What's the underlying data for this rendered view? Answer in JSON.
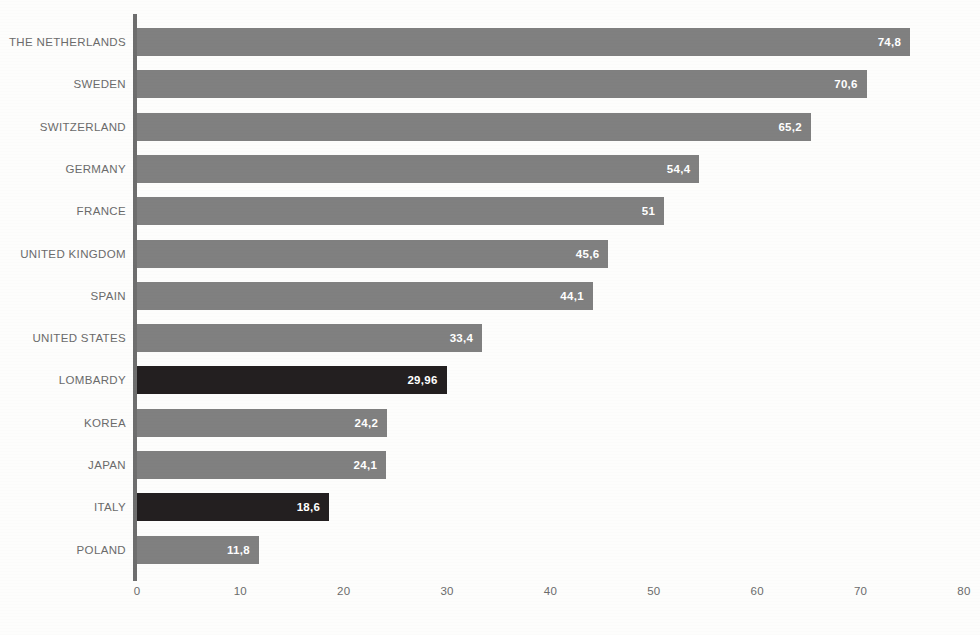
{
  "chart_data": {
    "type": "bar",
    "orientation": "horizontal",
    "title": "",
    "subtitle": "",
    "xlabel": "",
    "ylabel": "",
    "xlim": [
      0,
      80
    ],
    "xticks": [
      "0",
      "10",
      "20",
      "30",
      "40",
      "50",
      "60",
      "70",
      "80"
    ],
    "xtick_values": [
      0,
      10,
      20,
      30,
      40,
      50,
      60,
      70,
      80
    ],
    "grid": false,
    "legend": "none",
    "decimal_separator": ",",
    "categories": [
      "THE NETHERLANDS",
      "SWEDEN",
      "SWITZERLAND",
      "GERMANY",
      "FRANCE",
      "UNITED KINGDOM",
      "SPAIN",
      "UNITED STATES",
      "LOMBARDY",
      "KOREA",
      "JAPAN",
      "ITALY",
      "POLAND"
    ],
    "values": [
      74.8,
      70.6,
      65.2,
      54.4,
      51,
      45.6,
      44.1,
      33.4,
      29.96,
      24.2,
      24.1,
      18.6,
      11.8
    ],
    "value_labels": [
      "74,8",
      "70,6",
      "65,2",
      "54,4",
      "51",
      "45,6",
      "44,1",
      "33,4",
      "29,96",
      "24,2",
      "24,1",
      "18,6",
      "11,8"
    ],
    "highlighted": [
      false,
      false,
      false,
      false,
      false,
      false,
      false,
      false,
      true,
      false,
      false,
      true,
      false
    ],
    "bars": [
      {
        "category": "THE NETHERLANDS",
        "value": 74.8,
        "label": "74,8",
        "highlight": false
      },
      {
        "category": "SWEDEN",
        "value": 70.6,
        "label": "70,6",
        "highlight": false
      },
      {
        "category": "SWITZERLAND",
        "value": 65.2,
        "label": "65,2",
        "highlight": false
      },
      {
        "category": "GERMANY",
        "value": 54.4,
        "label": "54,4",
        "highlight": false
      },
      {
        "category": "FRANCE",
        "value": 51,
        "label": "51",
        "highlight": false
      },
      {
        "category": "UNITED KINGDOM",
        "value": 45.6,
        "label": "45,6",
        "highlight": false
      },
      {
        "category": "SPAIN",
        "value": 44.1,
        "label": "44,1",
        "highlight": false
      },
      {
        "category": "UNITED STATES",
        "value": 33.4,
        "label": "33,4",
        "highlight": false
      },
      {
        "category": "LOMBARDY",
        "value": 29.96,
        "label": "29,96",
        "highlight": true
      },
      {
        "category": "KOREA",
        "value": 24.2,
        "label": "24,2",
        "highlight": false
      },
      {
        "category": "JAPAN",
        "value": 24.1,
        "label": "24,1",
        "highlight": false
      },
      {
        "category": "ITALY",
        "value": 18.6,
        "label": "18,6",
        "highlight": true
      },
      {
        "category": "POLAND",
        "value": 11.8,
        "label": "11,8",
        "highlight": false
      }
    ],
    "colors": {
      "bar": "#808080",
      "bar_highlight": "#231f20",
      "value_text": "#ffffff",
      "category_text": "#6b6b6b",
      "axis": "#6e6e6e",
      "background": "#fdfdfc"
    }
  }
}
